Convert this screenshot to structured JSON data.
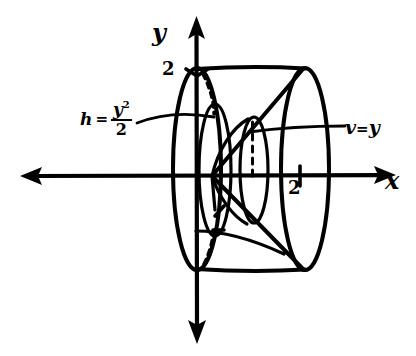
{
  "figure": {
    "background_color": "#ffffff",
    "ink_color": "#000000",
    "style": "hand-drawn pencil sketch"
  },
  "axes": {
    "x_label": "x",
    "y_label": "y",
    "x_tick_label": "2",
    "y_tick_label": "2",
    "x_arrow_left": "arrow-left",
    "x_arrow_right": "arrow-right",
    "y_arrow_up": "arrow-up",
    "y_arrow_down": "arrow-down"
  },
  "annotations": {
    "height": {
      "variable": "h",
      "equals": "=",
      "numerator": "y",
      "exponent": "2",
      "denominator": "2",
      "full_text": "h = y²/2"
    },
    "radius": {
      "variable": "v",
      "equals": "=",
      "value": "y",
      "full_text": "v = y"
    }
  },
  "icons": {
    "arrow_up": "arrow-up-icon",
    "arrow_down": "arrow-down-icon",
    "arrow_left": "arrow-left-icon",
    "arrow_right": "arrow-right-icon"
  }
}
